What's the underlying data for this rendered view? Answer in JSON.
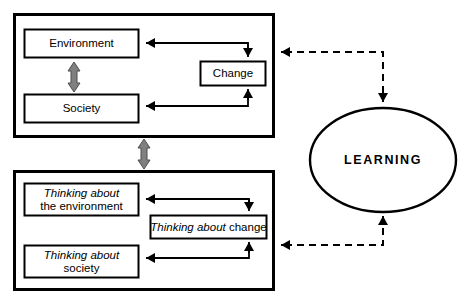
{
  "diagram": {
    "colors": {
      "stroke": "#000000",
      "gray_arrow": "#808080",
      "gray_arrow_outline": "#4d4d4d",
      "background": "#ffffff"
    },
    "top_frame": {
      "name": "reality-system-frame",
      "nodes": {
        "environment": {
          "label": "Environment",
          "italic_prefix": "",
          "regular_text": "Environment"
        },
        "society": {
          "label": "Society",
          "italic_prefix": "",
          "regular_text": "Society"
        },
        "change": {
          "label": "Change",
          "italic_prefix": "",
          "regular_text": "Change"
        }
      }
    },
    "bottom_frame": {
      "name": "thinking-system-frame",
      "nodes": {
        "thinking_environment": {
          "label": "Thinking about the environment",
          "italic_prefix": "Thinking about",
          "regular_text": "the environment"
        },
        "thinking_society": {
          "label": "Thinking about society",
          "italic_prefix": "Thinking about",
          "regular_text": "society"
        },
        "thinking_change": {
          "label": "Thinking about change",
          "italic_prefix": "Thinking about",
          "regular_text": "change"
        }
      }
    },
    "learning": {
      "label": "LEARNING"
    },
    "connectors": {
      "env_society_link": "bidirectional-gray-arrow",
      "frames_link": "bidirectional-gray-arrow",
      "change_to_environment": "solid-arrow",
      "change_to_society": "solid-arrow",
      "environment_to_change": "solid-arrow",
      "society_to_change": "solid-arrow",
      "top_frame_to_learning": "dashed-arrow",
      "learning_to_top_frame": "dashed-arrow",
      "bottom_frame_to_learning": "dashed-arrow",
      "learning_to_bottom_frame": "dashed-arrow"
    }
  }
}
